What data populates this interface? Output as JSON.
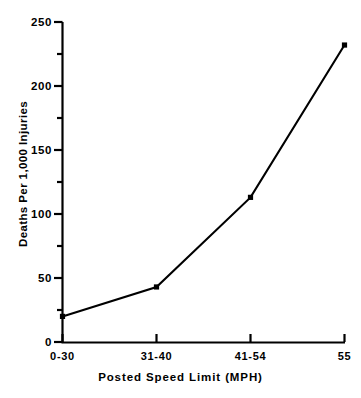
{
  "chart_data": {
    "type": "line",
    "title": "",
    "xlabel": "Posted Speed Limit   (MPH)",
    "ylabel": "Deaths Per 1,000 Injuries",
    "categories": [
      "0-30",
      "31-40",
      "41-54",
      "55"
    ],
    "values": [
      20,
      43,
      113,
      232
    ],
    "series": [
      {
        "name": "Deaths Per 1,000 Injuries",
        "values": [
          20,
          43,
          113,
          232
        ]
      }
    ],
    "ylim": [
      0,
      250
    ],
    "y_major_ticks": [
      0,
      50,
      100,
      150,
      200,
      250
    ],
    "y_major_tick_labels": [
      "0",
      "50",
      "100",
      "150",
      "200",
      "250"
    ],
    "y_minor_ticks": [
      25,
      75,
      125,
      175,
      225
    ],
    "x_tick_labels": [
      "0-30",
      "31-40",
      "41-54",
      "55"
    ],
    "grid": false,
    "legend": null,
    "marker": "square",
    "line_color": "#000000",
    "marker_color": "#000000",
    "background_color": "#ffffff"
  },
  "axes": {
    "y_label_text": "Deaths Per 1,000 Injuries",
    "x_label_text": "Posted Speed Limit   (MPH)"
  }
}
